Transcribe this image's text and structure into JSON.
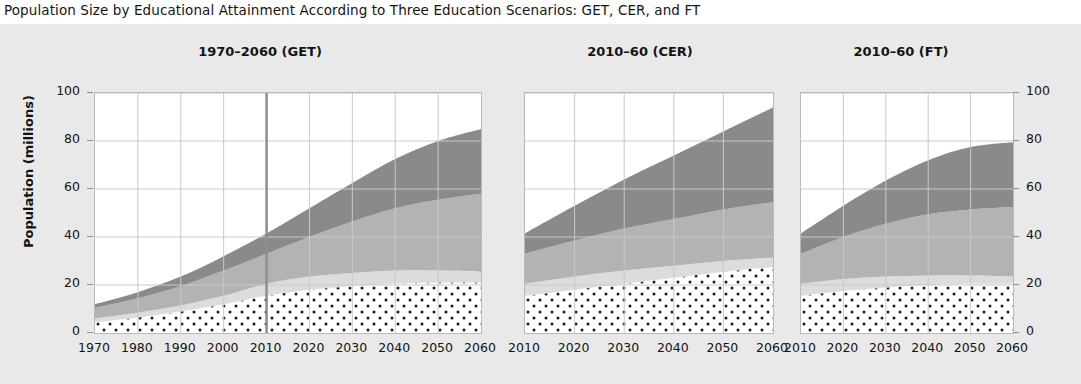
{
  "figure": {
    "title": "Population Size by Educational Attainment According to Three Education Scenarios:  GET, CER, and FT",
    "background_color": "#e9e9e9",
    "plot_background_color": "#ffffff",
    "axis_label_color": "#141414"
  },
  "axes": {
    "y_axis_title": "Population (millions)",
    "y_ticks": [
      "0",
      "20",
      "40",
      "60",
      "80",
      "100"
    ],
    "y_tick_values": [
      0,
      20,
      40,
      60,
      80,
      100
    ],
    "y_min": 0,
    "y_max": 100,
    "grid": true
  },
  "panels": [
    {
      "id": "get",
      "title": "1970–2060 (GET)",
      "x_ticks": [
        "1970",
        "1980",
        "1990",
        "2000",
        "2010",
        "2020",
        "2030",
        "2040",
        "2050",
        "2060"
      ],
      "marker_line_year": 2010,
      "y_axis_side": "left"
    },
    {
      "id": "cer",
      "title": "2010–60 (CER)",
      "x_ticks": [
        "2010",
        "2020",
        "2030",
        "2040",
        "2050",
        "2060"
      ],
      "marker_line_year": null,
      "y_axis_side": "none"
    },
    {
      "id": "ft",
      "title": "2010–60 (FT)",
      "x_ticks": [
        "2010",
        "2020",
        "2030",
        "2040",
        "2050",
        "2060"
      ],
      "marker_line_year": null,
      "y_axis_side": "right"
    }
  ],
  "chart_data": {
    "type": "area",
    "title": "Population Size by Educational Attainment According to Three Education Scenarios:  GET, CER, and FT",
    "xlabel": "",
    "ylabel": "Population (millions)",
    "ylim": [
      0,
      100
    ],
    "grid": true,
    "legend_position": "none",
    "stacking": "stacked",
    "layer_styles": [
      {
        "name": "layer-1-dotted",
        "fill": "#ffffff",
        "pattern": "dots",
        "dot_color": "#1b1b1b"
      },
      {
        "name": "layer-2-light",
        "fill": "#dcdcdc",
        "pattern": "solid"
      },
      {
        "name": "layer-3-medium",
        "fill": "#b3b3b3",
        "pattern": "solid"
      },
      {
        "name": "layer-4-dark",
        "fill": "#8a8a8a",
        "pattern": "solid"
      }
    ],
    "panels": [
      {
        "name": "1970–2060 (GET)",
        "x": [
          1970,
          1980,
          1990,
          2000,
          2010,
          2020,
          2030,
          2040,
          2050,
          2060
        ],
        "xlim": [
          1970,
          2060
        ],
        "marker_line_x": 2010,
        "series": [
          {
            "name": "layer-1-dotted",
            "values": [
              4.5,
              6.5,
              9.0,
              12.0,
              15.5,
              18.0,
              19.5,
              20.5,
              21.0,
              21.0
            ]
          },
          {
            "name": "layer-2-light",
            "values": [
              1.5,
              2.0,
              2.5,
              3.5,
              5.0,
              5.5,
              5.5,
              5.5,
              5.0,
              4.5
            ]
          },
          {
            "name": "layer-3-medium",
            "values": [
              4.5,
              6.0,
              8.0,
              10.5,
              12.5,
              16.5,
              21.5,
              26.0,
              29.5,
              32.5
            ]
          },
          {
            "name": "layer-4-dark",
            "values": [
              1.5,
              2.5,
              4.0,
              6.0,
              8.5,
              12.0,
              16.0,
              20.5,
              24.5,
              27.0
            ]
          }
        ],
        "totals": [
          12.0,
          17.0,
          23.5,
          32.0,
          41.5,
          52.0,
          62.5,
          72.5,
          80.0,
          85.0
        ]
      },
      {
        "name": "2010–60 (CER)",
        "x": [
          2010,
          2020,
          2030,
          2040,
          2050,
          2060
        ],
        "xlim": [
          2010,
          2060
        ],
        "marker_line_x": null,
        "series": [
          {
            "name": "layer-1-dotted",
            "values": [
              15.5,
              18.0,
              20.5,
              23.0,
              25.5,
              27.5
            ]
          },
          {
            "name": "layer-2-light",
            "values": [
              5.0,
              5.5,
              5.5,
              5.0,
              4.5,
              4.0
            ]
          },
          {
            "name": "layer-3-medium",
            "values": [
              12.5,
              15.0,
              17.5,
              19.5,
              21.5,
              23.0
            ]
          },
          {
            "name": "layer-4-dark",
            "values": [
              8.5,
              14.5,
              20.5,
              26.5,
              32.5,
              39.5
            ]
          }
        ],
        "totals": [
          41.5,
          53.0,
          64.0,
          74.0,
          84.0,
          94.0
        ]
      },
      {
        "name": "2010–60 (FT)",
        "x": [
          2010,
          2020,
          2030,
          2040,
          2050,
          2060
        ],
        "xlim": [
          2010,
          2060
        ],
        "marker_line_x": null,
        "series": [
          {
            "name": "layer-1-dotted",
            "values": [
              15.5,
              17.5,
              19.0,
              20.0,
              20.5,
              20.5
            ]
          },
          {
            "name": "layer-2-light",
            "values": [
              5.0,
              5.0,
              4.5,
              4.0,
              3.5,
              3.0
            ]
          },
          {
            "name": "layer-3-medium",
            "values": [
              12.5,
              17.5,
              22.0,
              25.5,
              27.5,
              29.0
            ]
          },
          {
            "name": "layer-4-dark",
            "values": [
              8.5,
              13.0,
              18.0,
              22.5,
              26.0,
              27.0
            ]
          }
        ],
        "totals": [
          41.5,
          53.0,
          63.5,
          72.0,
          77.5,
          79.5
        ]
      }
    ]
  }
}
